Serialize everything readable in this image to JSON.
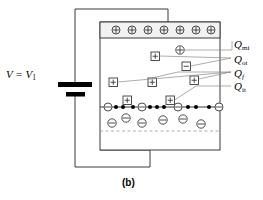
{
  "figure": {
    "caption": "(b)",
    "voltage_label": {
      "main": "V = V",
      "sub": "1"
    },
    "labels": [
      {
        "id": "q-mi",
        "q": "Q",
        "sub": "mi",
        "x": 234,
        "y": 38
      },
      {
        "id": "q-ot",
        "q": "Q",
        "sub": "ot",
        "x": 234,
        "y": 55
      },
      {
        "id": "q-f",
        "q": "Q",
        "sub": "f",
        "x": 234,
        "y": 71,
        "italic_sub": true
      },
      {
        "id": "q-it",
        "q": "Q",
        "sub": "it",
        "x": 234,
        "y": 84
      }
    ],
    "colors": {
      "line": "#3a3a3a",
      "fill": "#ffffff",
      "gate_fill": "#f2f2f2",
      "charge_dot": "#000000",
      "leader": "#8a8a8a"
    },
    "gate_charges": {
      "symbol": "plus",
      "count": 7,
      "x": [
        116,
        132,
        148,
        164,
        180,
        196,
        211
      ],
      "y": 30
    },
    "oxide_charges": [
      {
        "type": "circle-plus",
        "x": 180,
        "y": 50,
        "name": "mobile-ionic-charge"
      },
      {
        "type": "square-plus",
        "x": 155,
        "y": 56,
        "name": "oxide-trapped-charge-1"
      },
      {
        "type": "square-minus",
        "x": 186,
        "y": 66,
        "name": "oxide-trapped-charge-2"
      },
      {
        "type": "square-plus",
        "x": 113,
        "y": 82,
        "name": "fixed-oxide-charge-1"
      },
      {
        "type": "square-plus",
        "x": 152,
        "y": 82,
        "name": "fixed-oxide-charge-2"
      },
      {
        "type": "square-plus",
        "x": 194,
        "y": 80,
        "name": "fixed-oxide-charge-3"
      }
    ],
    "interface_traps": [
      {
        "type": "square-plus",
        "x": 127,
        "y": 100,
        "name": "interface-trap-1"
      },
      {
        "type": "square-plus",
        "x": 170,
        "y": 100,
        "name": "interface-trap-2"
      }
    ],
    "interface_line_y": 107,
    "interface_circle_minus": {
      "x": [
        108,
        142,
        178,
        219
      ],
      "y": 107
    },
    "interface_dots": {
      "x": [
        116,
        123,
        133,
        150,
        157,
        164,
        188,
        196,
        209
      ],
      "y": 107,
      "r": 2
    },
    "depletion_charges": {
      "symbol": "minus",
      "items": [
        {
          "x": 112,
          "y": 123
        },
        {
          "x": 126,
          "y": 118
        },
        {
          "x": 142,
          "y": 123
        },
        {
          "x": 163,
          "y": 120
        },
        {
          "x": 183,
          "y": 119
        },
        {
          "x": 201,
          "y": 124
        }
      ]
    },
    "depletion_edge_y": 131,
    "device": {
      "x": 100,
      "y": 22,
      "w": 120,
      "h": 128
    },
    "gate_band": {
      "x": 100,
      "y": 22,
      "w": 120,
      "h": 16
    }
  }
}
